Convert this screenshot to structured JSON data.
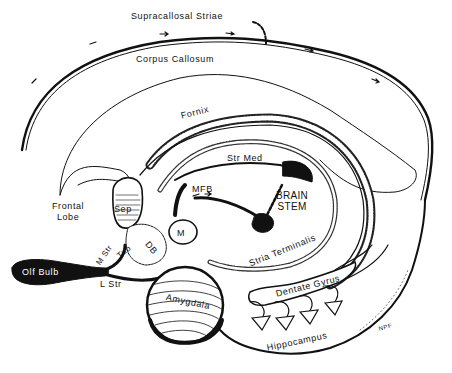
{
  "figure": {
    "colors": {
      "ink": "#111111",
      "paper": "#ffffff"
    },
    "labels": {
      "supracallosal_striae": "Supracallosal Striae",
      "corpus_callosum": "Corpus Callosum",
      "fornix": "Fornix",
      "str_med": "Str Med",
      "mfb": "MFB",
      "brain_stem_1": "BRAIN",
      "brain_stem_2": "STEM",
      "frontal_lobe_1": "Frontal",
      "frontal_lobe_2": "Lobe",
      "sep": "Sep",
      "m": "M",
      "db": "DB",
      "tub": "Tub",
      "m_str": "M Str",
      "olf_bulb": "Olf Bulb",
      "l_str": "L Str",
      "amygdala": "Amygdala",
      "stria_terminalis": "Stria Terminalis",
      "dentate_gyrus": "Dentate Gyrus",
      "hippocampus": "Hippocampus",
      "signature": "NPF"
    }
  }
}
